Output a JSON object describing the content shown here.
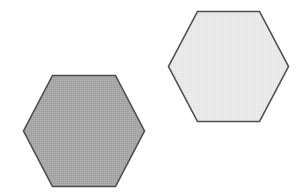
{
  "canvas": {
    "width": 307,
    "height": 195,
    "background_color": "#ffffff",
    "title": "Two Hexagons"
  },
  "shapes": [
    {
      "name": "hexagon-left",
      "label": "Left hexagon",
      "orientation": "flat-top",
      "fill_color": "#a8a8a8",
      "stroke_color": "#4d4d4d",
      "stroke_width": 1.6,
      "texture": "dither",
      "bounds": {
        "x": 23,
        "y": 75,
        "width": 122,
        "height": 112
      },
      "center": {
        "x": 84,
        "y": 131
      },
      "points": "52.5,75.5 115.5,75.5 144.5,131 115.5,186.5 52.5,186.5 23.5,131"
    },
    {
      "name": "hexagon-right",
      "label": "Right hexagon",
      "orientation": "flat-top",
      "fill_color": "#e9e9e9",
      "stroke_color": "#4d4d4d",
      "stroke_width": 1.6,
      "texture": "dither",
      "bounds": {
        "x": 168,
        "y": 11,
        "width": 121,
        "height": 111
      },
      "center": {
        "x": 228.5,
        "y": 66.5
      },
      "points": "197.5,11.5 259.5,11.5 288.5,66.5 259.5,121.5 197.5,121.5 168.5,66.5"
    }
  ]
}
